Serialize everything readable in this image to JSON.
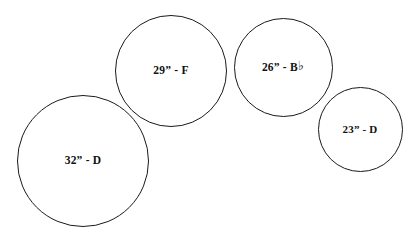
{
  "diagram": {
    "background_color": "#ffffff",
    "stroke_color": "#1a1a1a",
    "text_color": "#111111",
    "width": 419,
    "height": 240
  },
  "circles": [
    {
      "name": "drum-32-d",
      "label": "32” - D",
      "size": "32”",
      "note": "D",
      "has_flat": false,
      "center_x": 83,
      "center_y": 161,
      "diameter": 132,
      "stroke_width": 1.6,
      "font_size": 11.5,
      "label_offset_y": 0
    },
    {
      "name": "drum-29-f",
      "label": "29” - F",
      "size": "29”",
      "note": "F",
      "has_flat": false,
      "center_x": 171,
      "center_y": 71,
      "diameter": 112,
      "stroke_width": 1.6,
      "font_size": 11.5,
      "label_offset_y": 0
    },
    {
      "name": "drum-26-bb",
      "label": "26” - B",
      "size": "26”",
      "note": "B♭",
      "has_flat": true,
      "flat_glyph": "♭",
      "center_x": 283,
      "center_y": 67,
      "diameter": 99,
      "stroke_width": 1.6,
      "font_size": 11.5,
      "label_offset_y": 0
    },
    {
      "name": "drum-23-d",
      "label": "23” - D",
      "size": "23”",
      "note": "D",
      "has_flat": false,
      "center_x": 360,
      "center_y": 129,
      "diameter": 85,
      "stroke_width": 1.6,
      "font_size": 11,
      "label_offset_y": 0
    }
  ]
}
